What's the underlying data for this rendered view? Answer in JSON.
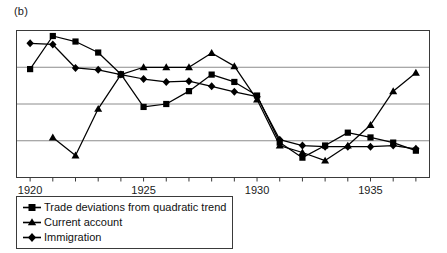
{
  "panel": {
    "label": "(b)"
  },
  "legend": {
    "items": [
      {
        "label": "Trade deviations from quadratic trend",
        "marker": "square-marker-icon"
      },
      {
        "label": "Current account",
        "marker": "triangle-marker-icon"
      },
      {
        "label": "Immigration",
        "marker": "diamond-marker-icon"
      }
    ]
  },
  "axis": {
    "x_tick_labels": [
      "1920",
      "1925",
      "1930",
      "1935"
    ],
    "x_tick_years": [
      1920,
      1921,
      1922,
      1923,
      1924,
      1925,
      1926,
      1927,
      1928,
      1929,
      1930,
      1931,
      1932,
      1933,
      1934,
      1935,
      1936,
      1937
    ],
    "y_tick_labels": []
  },
  "colors": {
    "line": "#000000",
    "grid": "#8c8c8c",
    "frame": "#3a3a3a",
    "background": "#ffffff"
  },
  "chart_data": {
    "type": "line",
    "title": "",
    "subtitle": "",
    "xlabel": "",
    "ylabel": "",
    "xlim": [
      1919.4,
      1937.6
    ],
    "ylim": [
      0,
      4
    ],
    "grid": true,
    "grid_y": [
      0,
      1,
      2,
      3,
      4
    ],
    "legend_position": "below-left",
    "x": [
      1920,
      1921,
      1922,
      1923,
      1924,
      1925,
      1926,
      1927,
      1928,
      1929,
      1930,
      1931,
      1932,
      1933,
      1934,
      1935,
      1936,
      1937
    ],
    "series": [
      {
        "name": "Trade deviations from quadratic trend",
        "marker": "square",
        "x": [
          1920,
          1921,
          1922,
          1923,
          1924,
          1925,
          1926,
          1927,
          1928,
          1929,
          1930,
          1931,
          1932,
          1933,
          1934,
          1935,
          1936,
          1937
        ],
        "values": [
          2.95,
          3.85,
          3.7,
          3.4,
          2.81,
          1.92,
          2.0,
          2.35,
          2.8,
          2.6,
          2.23,
          0.95,
          0.54,
          0.87,
          1.22,
          1.09,
          0.95,
          0.73
        ]
      },
      {
        "name": "Current account",
        "marker": "triangle",
        "x": [
          1921,
          1922,
          1923,
          1924,
          1925,
          1926,
          1927,
          1928,
          1929,
          1930,
          1931,
          1932,
          1933,
          1934,
          1935,
          1936,
          1937
        ],
        "values": [
          1.09,
          0.6,
          1.87,
          2.8,
          3.0,
          3.0,
          3.0,
          3.39,
          3.03,
          2.12,
          0.87,
          0.68,
          0.46,
          0.87,
          1.43,
          2.35,
          2.85
        ]
      },
      {
        "name": "Immigration",
        "marker": "diamond",
        "x": [
          1920,
          1921,
          1922,
          1923,
          1924,
          1925,
          1926,
          1927,
          1928,
          1929,
          1930,
          1931,
          1932,
          1933,
          1934,
          1935,
          1936,
          1937
        ],
        "values": [
          3.65,
          3.62,
          2.98,
          2.93,
          2.8,
          2.68,
          2.6,
          2.62,
          2.48,
          2.33,
          2.2,
          1.03,
          0.87,
          0.84,
          0.84,
          0.84,
          0.87,
          0.78
        ]
      }
    ]
  }
}
